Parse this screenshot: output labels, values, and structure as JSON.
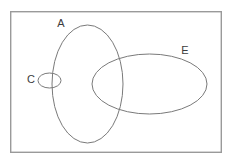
{
  "diagram": {
    "type": "venn-diagram",
    "canvas": {
      "width": 232,
      "height": 163,
      "background": "#ffffff"
    },
    "universe": {
      "name": "universal-set-box",
      "x": 10,
      "y": 11,
      "width": 212,
      "height": 142,
      "stroke": "#9a9a9a",
      "stroke_width": 1.4,
      "fill": "none"
    },
    "sets": [
      {
        "id": "A",
        "label": "A",
        "shape": "ellipse",
        "cx": 87.5,
        "cy": 84,
        "rx": 35.5,
        "ry": 59,
        "stroke": "#7a7a7a",
        "stroke_width": 1,
        "fill": "none",
        "label_x": 61,
        "label_y": 24
      },
      {
        "id": "E",
        "label": "E",
        "shape": "ellipse",
        "cx": 149.5,
        "cy": 84,
        "rx": 57.5,
        "ry": 30,
        "stroke": "#7a7a7a",
        "stroke_width": 1,
        "fill": "none",
        "label_x": 185,
        "label_y": 51
      },
      {
        "id": "C",
        "label": "C",
        "shape": "ellipse",
        "cx": 49.5,
        "cy": 80.5,
        "rx": 11.5,
        "ry": 7.5,
        "stroke": "#7a7a7a",
        "stroke_width": 1,
        "fill": "none",
        "label_x": 31,
        "label_y": 80
      }
    ],
    "relations": [
      "A and E overlap",
      "C straddles the left boundary of A",
      "C and E are disjoint"
    ]
  }
}
